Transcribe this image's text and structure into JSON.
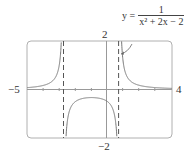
{
  "chart_data": {
    "type": "line",
    "title": "",
    "function": "y = 1/(x^2 + 2x - 2)",
    "xlim": [
      -5,
      4
    ],
    "ylim": [
      -2,
      2
    ],
    "tick_labels": {
      "x_min": "−5",
      "x_max": "4",
      "y_max": "2",
      "y_min": "−2"
    },
    "asymptotes_x": [
      -2.732,
      0.732
    ],
    "grid": false,
    "annotation": {
      "text": "y = 1/(x² + 2x − 2)",
      "lhs": "y =",
      "numerator": "1",
      "denominator": "x² + 2x − 2"
    },
    "series": [
      {
        "name": "left branch",
        "x": [
          -5,
          -4,
          -3.5,
          -3,
          -2.9,
          -2.8
        ],
        "y": [
          0.077,
          0.167,
          0.286,
          1.0,
          1.69,
          5.6
        ]
      },
      {
        "name": "middle branch",
        "x": [
          -2.6,
          -2.5,
          -2,
          -1,
          0,
          0.5,
          0.6
        ],
        "y": [
          -1.45,
          -0.8,
          -0.5,
          -0.333,
          -0.5,
          -0.8,
          -1.45
        ]
      },
      {
        "name": "right branch",
        "x": [
          0.8,
          1,
          1.5,
          2,
          3,
          4
        ],
        "y": [
          3.57,
          1.0,
          0.4,
          0.167,
          0.077,
          0.045
        ]
      }
    ]
  },
  "colors": {
    "curve": "#777777",
    "frame": "#aaaaaa",
    "axis": "#888888",
    "text": "#333333"
  }
}
